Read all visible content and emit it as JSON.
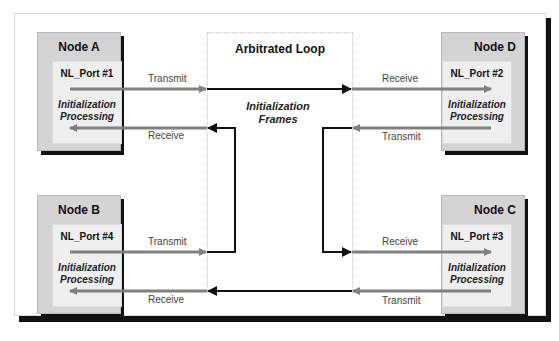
{
  "loop": {
    "title": "Arbitrated Loop",
    "center_label_1": "Initialization",
    "center_label_2": "Frames"
  },
  "nodes": [
    {
      "title": "Node A",
      "port": "NL_Port #1",
      "proc_1": "Initialization",
      "proc_2": "Processing",
      "top_label": "Transmit",
      "bottom_label": "Receive"
    },
    {
      "title": "Node D",
      "port": "NL_Port #2",
      "proc_1": "Initialization",
      "proc_2": "Processing",
      "top_label": "Receive",
      "bottom_label": "Transmit"
    },
    {
      "title": "Node B",
      "port": "NL_Port #4",
      "proc_1": "Initialization",
      "proc_2": "Processing",
      "top_label": "Transmit",
      "bottom_label": "Receive"
    },
    {
      "title": "Node C",
      "port": "NL_Port #3",
      "proc_1": "Initialization",
      "proc_2": "Processing",
      "top_label": "Receive",
      "bottom_label": "Transmit"
    }
  ],
  "colors": {
    "loop_line": "#111111",
    "port_line": "#808080",
    "node_bg": "#d4d4d4",
    "port_bg": "#efefef"
  }
}
